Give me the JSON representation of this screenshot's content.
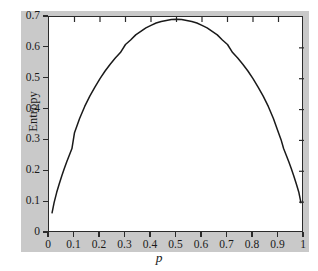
{
  "chart_data": {
    "type": "line",
    "title": "",
    "xlabel": "p",
    "ylabel": "Entropy",
    "xlim": [
      0,
      1
    ],
    "ylim": [
      0,
      0.7
    ],
    "grid": false,
    "legend": null,
    "xticks": [
      "0",
      "0.1",
      "0.2",
      "0.3",
      "0.4",
      "0.5",
      "0.6",
      "0.7",
      "0.8",
      "0.9",
      "1"
    ],
    "xtick_values": [
      0,
      0.1,
      0.2,
      0.3,
      0.4,
      0.5,
      0.6,
      0.7,
      0.8,
      0.9,
      1
    ],
    "yticks": [
      "0",
      "0.1",
      "0.2",
      "0.3",
      "0.4",
      "0.5",
      "0.6",
      "0.7"
    ],
    "ytick_values": [
      0,
      0.1,
      0.2,
      0.3,
      0.4,
      0.5,
      0.6,
      0.7
    ],
    "series": [
      {
        "name": "Entropy",
        "color": "#1a1a1a",
        "x": [
          0.012,
          0.02,
          0.03,
          0.04,
          0.05,
          0.06,
          0.07,
          0.08,
          0.09,
          0.1,
          0.12,
          0.14,
          0.16,
          0.18,
          0.2,
          0.22,
          0.24,
          0.26,
          0.28,
          0.3,
          0.32,
          0.34,
          0.36,
          0.38,
          0.4,
          0.42,
          0.44,
          0.46,
          0.48,
          0.5,
          0.52,
          0.54,
          0.56,
          0.58,
          0.6,
          0.62,
          0.64,
          0.66,
          0.68,
          0.7,
          0.72,
          0.74,
          0.76,
          0.78,
          0.8,
          0.82,
          0.84,
          0.86,
          0.88,
          0.9,
          0.91,
          0.92,
          0.93,
          0.94,
          0.95,
          0.96,
          0.97,
          0.98,
          0.988
        ],
        "y": [
          0.0654,
          0.0983,
          0.131,
          0.1589,
          0.1848,
          0.2088,
          0.2315,
          0.253,
          0.2736,
          0.3251,
          0.3712,
          0.4101,
          0.4437,
          0.473,
          0.5004,
          0.5249,
          0.547,
          0.5668,
          0.5847,
          0.6109,
          0.6254,
          0.642,
          0.6534,
          0.6645,
          0.673,
          0.6804,
          0.6854,
          0.6885,
          0.6917,
          0.6931,
          0.6917,
          0.6885,
          0.6854,
          0.6804,
          0.673,
          0.6645,
          0.6534,
          0.642,
          0.6254,
          0.6109,
          0.5847,
          0.5668,
          0.547,
          0.5249,
          0.5004,
          0.473,
          0.4437,
          0.4101,
          0.3712,
          0.3251,
          0.3025,
          0.2736,
          0.253,
          0.2315,
          0.2088,
          0.1848,
          0.1589,
          0.131,
          0.0983
        ],
        "formula": "H(p) = -p*ln(p) - (1-p)*ln(1-p)",
        "peak_x": 0.5,
        "peak_y": 0.693
      }
    ]
  },
  "axis": {
    "y_title": "Entropy",
    "x_title": "p"
  },
  "style": {
    "band_color": "#c9c9c9",
    "plot_bg": "#ffffff",
    "axis_color": "#2b2b2b",
    "curve_color": "#1a1a1a",
    "text_color": "#1a1a1a"
  }
}
